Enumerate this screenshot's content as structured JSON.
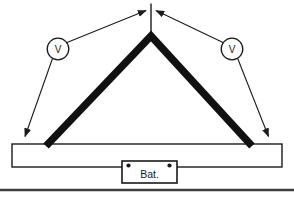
{
  "colors": {
    "ink": "#1a1a1a",
    "wire": "#111111",
    "background": "#ffffff",
    "separator": "#3f3f3f"
  },
  "diagram": {
    "left_voltmeter": {
      "label": "V"
    },
    "right_voltmeter": {
      "label": "V"
    },
    "battery": {
      "label": "Bat."
    }
  }
}
